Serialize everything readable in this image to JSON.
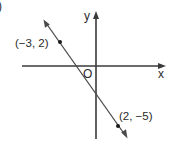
{
  "figure": {
    "fragment_label": ")",
    "axes": {
      "x_label": "x",
      "y_label": "y",
      "origin_label": "O"
    },
    "points": [
      {
        "label": "(−3, 2)",
        "x": -3,
        "y": 2
      },
      {
        "label": "(2, −5)",
        "x": 2,
        "y": -5
      }
    ],
    "line": {
      "description": "straight line through (-3, 2) and (2, -5) with arrows at both ends",
      "slope": -1.4
    },
    "colors": {
      "stroke": "#3a3a3a",
      "text": "#2a2a2a",
      "background": "#ffffff"
    }
  }
}
